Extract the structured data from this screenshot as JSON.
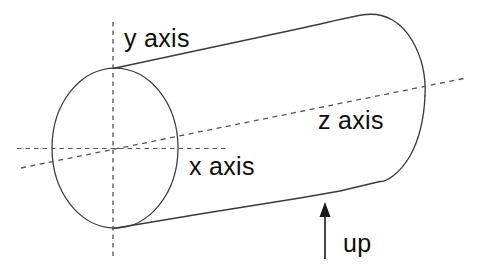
{
  "figure": {
    "type": "technical-diagram",
    "background_color": "#ffffff",
    "stroke_color": "#3a3a3a",
    "dashed_color": "#555555",
    "text_color": "#0d0d0d"
  },
  "labels": {
    "y_axis": "y axis",
    "x_axis": "x axis",
    "z_axis": "z axis",
    "up": "up"
  },
  "icons": {
    "up_arrow": "arrow-up-icon"
  },
  "geometry": {
    "cylinder": {
      "left_cap_ellipse": {
        "cx": 115,
        "cy": 148,
        "rx": 63,
        "ry": 80
      },
      "top_edge": {
        "x1": 113,
        "y1": 68,
        "x2": 366,
        "y2": 14
      },
      "bottom_edge": {
        "x1": 113,
        "y1": 228,
        "x2": 380,
        "y2": 181
      },
      "right_cap_rounded": true
    },
    "axes": {
      "y_axis_dashed_vertical": {
        "x": 113,
        "y1": 22,
        "y2": 256
      },
      "x_axis_dashed_horizontal": {
        "y": 148,
        "x1": 17,
        "x2": 226
      },
      "z_axis_dashed_diagonal": {
        "x1": 21,
        "y1": 168,
        "x2": 466,
        "y2": 78
      }
    },
    "up_arrow": {
      "x": 325,
      "y_tail": 259,
      "y_head": 203
    }
  }
}
